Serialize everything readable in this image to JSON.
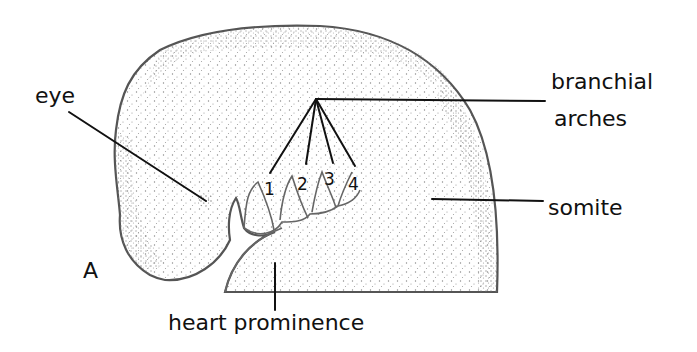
{
  "figure": {
    "panel_label": "A",
    "labels": {
      "eye": "eye",
      "branchial_line1": "branchial",
      "branchial_line2": "arches",
      "somite": "somite",
      "heart": "heart prominence"
    },
    "arch_numbers": [
      "1",
      "2",
      "3",
      "4"
    ],
    "colors": {
      "background": "#ffffff",
      "ink": "#111111",
      "outline": "#555555",
      "stipple": "#777777"
    }
  }
}
